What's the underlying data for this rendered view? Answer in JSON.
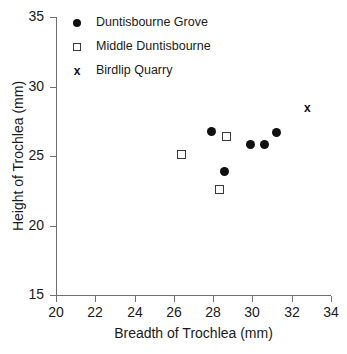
{
  "chart_data": {
    "type": "scatter",
    "title": "",
    "xlabel": "Breadth of Trochlea (mm)",
    "ylabel": "Height of Trochlea (mm)",
    "xlim": [
      20,
      34
    ],
    "ylim": [
      15,
      35
    ],
    "xticks": [
      20,
      22,
      24,
      26,
      28,
      30,
      32,
      34
    ],
    "yticks": [
      15,
      20,
      25,
      30,
      35
    ],
    "xtick_labels": [
      "20",
      "22",
      "24",
      "26",
      "28",
      "30",
      "32",
      "34"
    ],
    "ytick_labels": [
      "15",
      "20",
      "25",
      "30",
      "35"
    ],
    "grid": false,
    "legend_position": "top-left",
    "series": [
      {
        "name": "Duntisbourne Grove",
        "marker": "filled-circle",
        "marker_glyph": "●",
        "color": "#101010",
        "points": [
          {
            "x": 27.9,
            "y": 26.8
          },
          {
            "x": 28.6,
            "y": 23.9
          },
          {
            "x": 29.9,
            "y": 25.8
          },
          {
            "x": 30.6,
            "y": 25.8
          },
          {
            "x": 31.2,
            "y": 26.7
          }
        ]
      },
      {
        "name": "Middle Duntisbourne",
        "marker": "open-square",
        "marker_glyph": "□",
        "color": "#3a3a3a",
        "points": [
          {
            "x": 26.4,
            "y": 25.1
          },
          {
            "x": 28.3,
            "y": 22.6
          },
          {
            "x": 28.7,
            "y": 26.4
          }
        ]
      },
      {
        "name": "Birdlip Quarry",
        "marker": "x",
        "marker_glyph": "x",
        "color": "#101010",
        "points": [
          {
            "x": 32.8,
            "y": 28.4
          }
        ]
      }
    ]
  },
  "legend": {
    "entries": [
      {
        "label": "Duntisbourne Grove",
        "marker": "filled-circle"
      },
      {
        "label": "Middle Duntisbourne",
        "marker": "open-square"
      },
      {
        "label": "Birdlip Quarry",
        "marker": "x"
      }
    ]
  }
}
